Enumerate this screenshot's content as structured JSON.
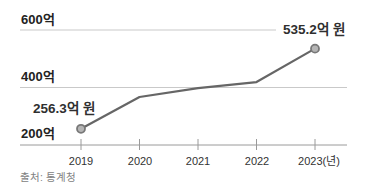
{
  "chart_data": {
    "type": "line",
    "x": [
      "2019",
      "2020",
      "2021",
      "2022",
      "2023"
    ],
    "values": [
      256.3,
      367,
      398,
      419,
      535.2
    ],
    "labeled_points": {
      "start": {
        "x": "2019",
        "value": 256.3,
        "label": "256.3억 원"
      },
      "end": {
        "x": "2023",
        "value": 535.2,
        "label": "535.2억 원"
      }
    },
    "x_tick_labels": [
      "2019",
      "2020",
      "2021",
      "2022",
      "2023(년)"
    ],
    "y_tick_labels": [
      "200억",
      "400억",
      "600억"
    ],
    "y_ticks": [
      200,
      400,
      600
    ],
    "ylim": [
      200,
      620
    ],
    "unit": "억 원",
    "grid": "horizontal-only",
    "legend": "none",
    "title": "",
    "source": "출처: 통계청",
    "colors": {
      "line": "#666666",
      "marker_fill": "#b5b5b5",
      "marker_stroke": "#787878",
      "grid": "#c9c9c9",
      "axis": "#9a9a9a",
      "label_text": "#2f2f2f",
      "source_text": "#828282",
      "background": "#ffffff"
    }
  }
}
